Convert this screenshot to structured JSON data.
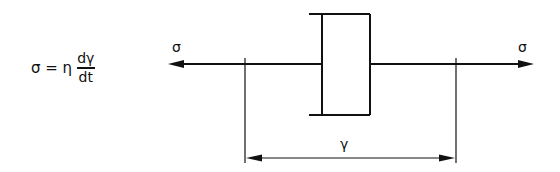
{
  "formula": {
    "lhs": "σ = η",
    "numerator": "dγ",
    "denominator": "dt"
  },
  "labels": {
    "stress_left": "σ",
    "stress_right": "σ",
    "strain": "γ"
  },
  "colors": {
    "line": "#111111",
    "background": "#ffffff"
  },
  "geometry": {
    "axis_y": 64,
    "arrow_left_tip_x": 168,
    "arrow_right_tip_x": 534,
    "dashpot": {
      "cylinder_left_x": 322,
      "cylinder_right_x": 370,
      "top_y": 14,
      "bottom_y": 115,
      "cap_left_x": 309
    },
    "dimension": {
      "left_x": 245,
      "right_x": 456,
      "line_y": 158,
      "tick_top_y": 58,
      "tick_bottom_y": 163
    }
  }
}
